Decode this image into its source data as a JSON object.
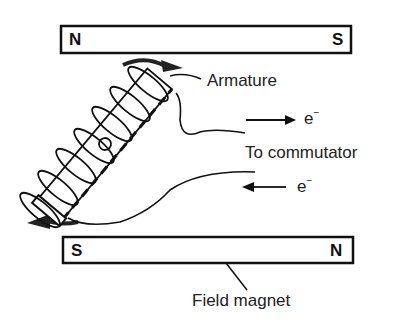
{
  "diagram": {
    "top_magnet": {
      "left_pole": "N",
      "right_pole": "S"
    },
    "bottom_magnet": {
      "left_pole": "S",
      "right_pole": "N"
    },
    "labels": {
      "armature": "Armature",
      "electron_out": "e",
      "electron_in": "e",
      "electron_charge": "−",
      "to_commutator": "To commutator",
      "field_magnet": "Field magnet"
    }
  }
}
